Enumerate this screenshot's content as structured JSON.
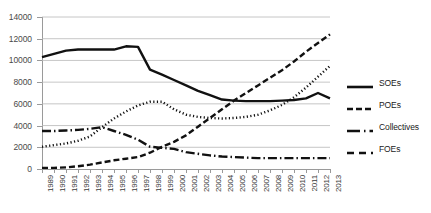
{
  "chart_data": {
    "type": "line",
    "title": "",
    "subtitle": "",
    "xlabel": "",
    "ylabel": "",
    "xlim": [
      1989,
      2013
    ],
    "ylim": [
      0,
      14000
    ],
    "grid": true,
    "legend_position": "right",
    "x": [
      1989,
      1990,
      1991,
      1992,
      1993,
      1994,
      1995,
      1996,
      1997,
      1998,
      1999,
      2000,
      2001,
      2002,
      2003,
      2004,
      2005,
      2006,
      2007,
      2008,
      2009,
      2010,
      2011,
      2012,
      2013
    ],
    "categories": [
      "1989",
      "1990",
      "1991",
      "1992",
      "1993",
      "1994",
      "1995",
      "1996",
      "1997",
      "1998",
      "1999",
      "2000",
      "2001",
      "2002",
      "2003",
      "2004",
      "2005",
      "2006",
      "2007",
      "2008",
      "2009",
      "2010",
      "2011",
      "2012",
      "2013"
    ],
    "yticks": [
      0,
      2000,
      4000,
      6000,
      8000,
      10000,
      12000,
      14000
    ],
    "ytick_labels": [
      "0",
      "2000",
      "4000",
      "6000",
      "8000",
      "10000",
      "12000",
      "14000"
    ],
    "series": [
      {
        "name": "SOEs",
        "style": "solid",
        "color": "#111111",
        "values": [
          10300,
          10600,
          10900,
          11000,
          11000,
          11000,
          11000,
          11300,
          11250,
          9150,
          8700,
          8200,
          7700,
          7200,
          6800,
          6400,
          6300,
          6250,
          6250,
          6250,
          6300,
          6350,
          6500,
          7000,
          6500
        ]
      },
      {
        "name": "POEs",
        "style": "dashed",
        "color": "#111111",
        "values": [
          100,
          100,
          150,
          250,
          400,
          600,
          800,
          950,
          1100,
          1500,
          2050,
          2500,
          3100,
          3900,
          4700,
          5500,
          6300,
          7000,
          7700,
          8400,
          9100,
          9900,
          10800,
          11600,
          12400
        ]
      },
      {
        "name": "Collectives",
        "style": "dashdot",
        "color": "#111111",
        "values": [
          3500,
          3500,
          3550,
          3600,
          3700,
          3850,
          3500,
          3150,
          2700,
          2050,
          1950,
          1850,
          1550,
          1400,
          1250,
          1150,
          1100,
          1050,
          1000,
          1000,
          1000,
          1000,
          1000,
          1000,
          1000
        ]
      },
      {
        "name": "FOEs",
        "style": "longdash",
        "color": "#111111",
        "values": [
          2050,
          2200,
          2350,
          2600,
          3000,
          3850,
          4650,
          5300,
          5850,
          6200,
          6200,
          5500,
          5000,
          4800,
          4700,
          4650,
          4700,
          4800,
          5000,
          5400,
          5900,
          6600,
          7500,
          8500,
          9500
        ]
      }
    ]
  },
  "legend": {
    "items": [
      {
        "label": "SOEs",
        "style": "solid"
      },
      {
        "label": "POEs",
        "style": "dashed"
      },
      {
        "label": "Collectives",
        "style": "dashdot"
      },
      {
        "label": "FOEs",
        "style": "longdash"
      }
    ]
  }
}
